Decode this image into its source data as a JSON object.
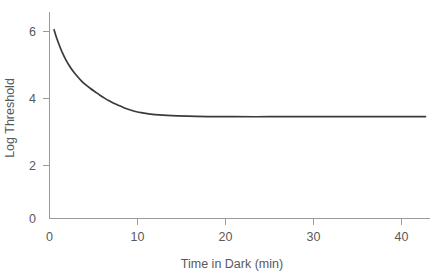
{
  "chart_data": {
    "type": "line",
    "title": "",
    "subtitle": "",
    "xlabel": "Time in Dark (min)",
    "ylabel": "Log Threshold",
    "xlim": [
      0,
      41.5
    ],
    "ylim": [
      0,
      7
    ],
    "grid": false,
    "legend": null,
    "legend_position": "none",
    "annotations": [],
    "xticks": [
      0,
      10,
      20,
      30,
      40
    ],
    "xtick_labels": [
      "0",
      "10",
      "20",
      "30",
      "40"
    ],
    "yticks": [
      0,
      2,
      4,
      6
    ],
    "ytick_labels": [
      "0",
      "2",
      "4",
      "6"
    ],
    "series": [
      {
        "name": "Dark adaptation threshold",
        "x": [
          0.5,
          0.8,
          1.1,
          1.4,
          1.8,
          2.2,
          2.6,
          3.0,
          3.5,
          4.0,
          4.5,
          5.0,
          5.5,
          6.0,
          6.5,
          7.0,
          7.5,
          8.0,
          8.5,
          9.0,
          9.5,
          10.0,
          11.0,
          12.0,
          14.0,
          16.0,
          18.0,
          20.0,
          24.0,
          28.0,
          32.0,
          36.0,
          41.0
        ],
        "y": [
          6.4,
          6.1,
          5.85,
          5.62,
          5.37,
          5.16,
          4.98,
          4.83,
          4.66,
          4.52,
          4.4,
          4.29,
          4.18,
          4.08,
          3.99,
          3.91,
          3.84,
          3.77,
          3.71,
          3.66,
          3.62,
          3.59,
          3.54,
          3.51,
          3.48,
          3.46,
          3.455,
          3.45,
          3.45,
          3.45,
          3.45,
          3.45,
          3.45
        ]
      }
    ]
  },
  "axes": {
    "y_label": "Log Threshold",
    "x_label": "Time in Dark (min)",
    "y_tick_0": "0",
    "y_tick_2": "2",
    "y_tick_4": "4",
    "y_tick_6": "6",
    "x_tick_0": "0",
    "x_tick_10": "10",
    "x_tick_20": "20",
    "x_tick_30": "30",
    "x_tick_40": "40"
  },
  "colors": {
    "curve": "#3a3a3a",
    "axis": "#9a9a9a",
    "text": "#58595b",
    "background": "#ffffff"
  }
}
